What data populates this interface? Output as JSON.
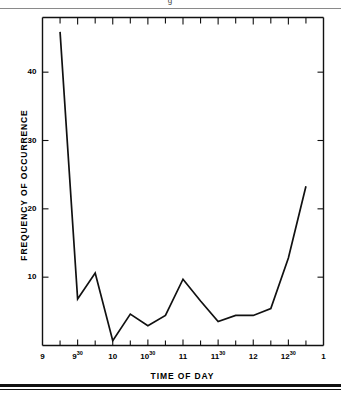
{
  "figure": {
    "clipped_caption_fragment": "g",
    "top_rule_color": "#8a8a8a",
    "bottom_rule_color": "#111111",
    "line_color": "#111111",
    "axis_color": "#111111",
    "background": "#ffffff"
  },
  "chart_data": {
    "type": "line",
    "title": "",
    "xlabel": "TIME OF DAY",
    "ylabel": "FREQUENCY OF OCCURRENCE",
    "grid": false,
    "legend": null,
    "xlim": [
      9.0,
      13.0
    ],
    "ylim": [
      0,
      48
    ],
    "ytick_values": [
      10,
      20,
      30,
      40
    ],
    "ytick_labels": [
      "10",
      "20",
      "30",
      "40"
    ],
    "xtick_values": [
      9.0,
      9.5,
      10.0,
      10.5,
      11.0,
      11.5,
      12.0,
      12.5,
      13.0
    ],
    "xtick_labels": [
      "9",
      "9³⁰",
      "10",
      "10³⁰",
      "11",
      "11³⁰",
      "12",
      "12³⁰",
      "1"
    ],
    "xtick_labels_html": [
      "9",
      "9<sup>30</sup>",
      "10",
      "10<sup>30</sup>",
      "11",
      "11<sup>30</sup>",
      "12",
      "12<sup>30</sup>",
      "1"
    ],
    "minor_tick_interval_hours": 0.25,
    "x": [
      9.25,
      9.5,
      9.75,
      10.0,
      10.25,
      10.5,
      10.75,
      11.0,
      11.25,
      11.5,
      11.75,
      12.0,
      12.25,
      12.5,
      12.75
    ],
    "x_time_labels": [
      "9:15",
      "9:30",
      "9:45",
      "10:00",
      "10:15",
      "10:30",
      "10:45",
      "11:00",
      "11:15",
      "11:30",
      "11:45",
      "12:00",
      "12:15",
      "12:30",
      "12:45"
    ],
    "values": [
      45.9,
      6.8,
      10.6,
      0.7,
      4.6,
      2.9,
      4.4,
      9.7,
      6.5,
      3.5,
      4.4,
      4.4,
      5.4,
      12.8,
      23.3
    ],
    "series": [
      {
        "name": "Frequency of occurrence",
        "values": [
          45.9,
          6.8,
          10.6,
          0.7,
          4.6,
          2.9,
          4.4,
          9.7,
          6.5,
          3.5,
          4.4,
          4.4,
          5.4,
          12.8,
          23.3
        ]
      }
    ]
  }
}
